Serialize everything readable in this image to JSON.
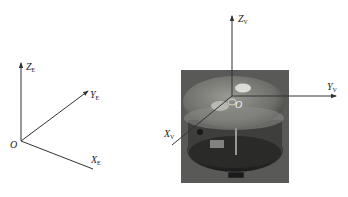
{
  "figure": {
    "earth_frame": {
      "origin_label": "O",
      "axes": [
        {
          "name": "Z",
          "subscript": "E"
        },
        {
          "name": "Y",
          "subscript": "E"
        },
        {
          "name": "X",
          "subscript": "E"
        }
      ]
    },
    "vehicle_frame": {
      "origin_label": "O",
      "axes": [
        {
          "name": "Z",
          "subscript": "V"
        },
        {
          "name": "Y",
          "subscript": "V"
        },
        {
          "name": "X",
          "subscript": "V"
        }
      ],
      "photo": "spherical robot photo"
    }
  }
}
